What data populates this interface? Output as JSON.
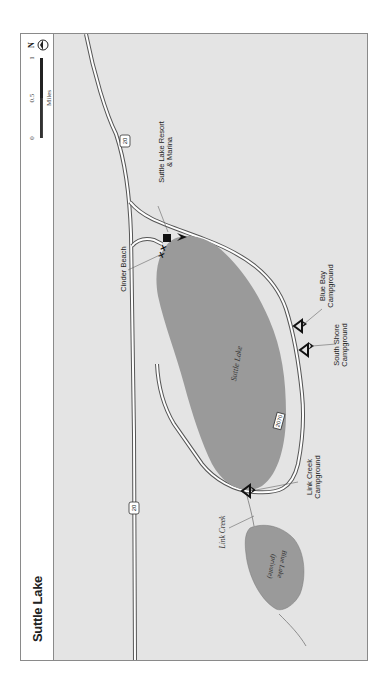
{
  "title": "Suttle Lake",
  "scale_bar": {
    "ticks": [
      "0",
      "0.5",
      "1"
    ],
    "unit": "Miles"
  },
  "north_arrow": {
    "label": "N",
    "icon": "north-arrow-icon"
  },
  "map": {
    "orientation": "rotated 90° (north points left)",
    "colors": {
      "land": "#e4e4e4",
      "water": "#9a9a9a",
      "road_casing": "#5a5a5a",
      "road_fill": "#ffffff",
      "frame": "#8a8a8a"
    },
    "highways": [
      {
        "shield": "20",
        "id": "hwy-20-upper"
      },
      {
        "shield": "20",
        "id": "hwy-20-lower"
      }
    ],
    "forest_roads": [
      {
        "shield": "2070"
      }
    ],
    "water_bodies": [
      {
        "name": "Suttle Lake"
      },
      {
        "name": "Blue Lake",
        "note": "(private)"
      }
    ],
    "streams": [
      {
        "name": "Link Creek"
      }
    ],
    "points_of_interest": [
      {
        "name": "Suttle Lake Resort & Marina",
        "line1": "Suttle Lake Resort",
        "line2": "& Marina",
        "icons": [
          "lodging-icon",
          "boat-launch-icon"
        ]
      },
      {
        "name": "Cinder Beach",
        "icons": [
          "picnic-icon"
        ]
      },
      {
        "name": "Blue Bay Campground",
        "line1": "Blue Bay",
        "line2": "Campground",
        "icons": [
          "campground-icon",
          "boat-launch-icon"
        ]
      },
      {
        "name": "South Shore Campground",
        "line1": "South Shore",
        "line2": "Campground",
        "icons": [
          "campground-icon",
          "boat-launch-icon"
        ]
      },
      {
        "name": "Link Creek Campground",
        "line1": "Link Creek",
        "line2": "Campground",
        "icons": [
          "campground-icon",
          "boat-launch-icon"
        ]
      }
    ]
  }
}
